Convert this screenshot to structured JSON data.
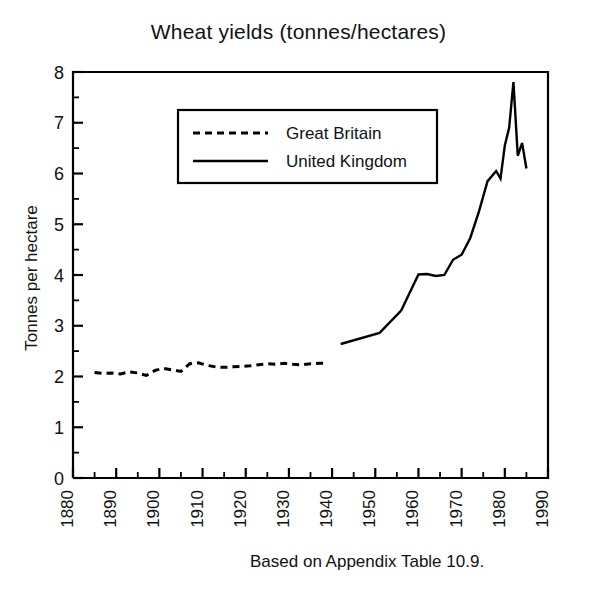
{
  "chart_data": {
    "type": "line",
    "title": "Wheat yields (tonnes/hectares)",
    "xlabel": "",
    "ylabel": "Tonnes per hectare",
    "xlim": [
      1880,
      1990
    ],
    "ylim": [
      0,
      8
    ],
    "grid": false,
    "legend_position": "upper-left-inside",
    "annotation": "Based on Appendix Table 10.9.",
    "x_ticks": [
      1880,
      1890,
      1900,
      1910,
      1920,
      1930,
      1940,
      1950,
      1960,
      1970,
      1980,
      1990
    ],
    "x_tick_labels": [
      "1880",
      "1890",
      "1900",
      "1910",
      "1920",
      "1930",
      "1940",
      "1950",
      "1960",
      "1970",
      "1980",
      "1990"
    ],
    "x_minor_tick_step": 5,
    "y_ticks": [
      0,
      1,
      2,
      3,
      4,
      5,
      6,
      7,
      8
    ],
    "y_tick_labels": [
      "0",
      "1",
      "2",
      "3",
      "4",
      "5",
      "6",
      "7",
      "8"
    ],
    "y_minor_tick_step": 0.5,
    "series": [
      {
        "name": "Great Britain",
        "style": "dashed",
        "color": "#000000",
        "x": [
          1885,
          1887,
          1889,
          1891,
          1893,
          1895,
          1897,
          1899,
          1901,
          1903,
          1905,
          1907,
          1909,
          1911,
          1913,
          1915,
          1917,
          1919,
          1921,
          1923,
          1925,
          1927,
          1929,
          1931,
          1933,
          1935,
          1937,
          1939
        ],
        "y": [
          2.08,
          2.06,
          2.07,
          2.05,
          2.09,
          2.07,
          2.02,
          2.12,
          2.16,
          2.13,
          2.1,
          2.25,
          2.27,
          2.22,
          2.19,
          2.18,
          2.19,
          2.2,
          2.21,
          2.23,
          2.25,
          2.24,
          2.26,
          2.24,
          2.23,
          2.25,
          2.26,
          2.26
        ]
      },
      {
        "name": "United Kingdom",
        "style": "solid",
        "color": "#000000",
        "x": [
          1942,
          1951,
          1956,
          1960,
          1962,
          1964,
          1966,
          1968,
          1970,
          1972,
          1974,
          1976,
          1978,
          1979,
          1980,
          1981,
          1982,
          1983,
          1984,
          1985
        ],
        "y": [
          2.64,
          2.86,
          3.3,
          4.01,
          4.02,
          3.98,
          4.0,
          4.3,
          4.4,
          4.73,
          5.25,
          5.85,
          6.05,
          5.9,
          6.55,
          6.9,
          7.8,
          6.35,
          6.6,
          6.1
        ]
      }
    ]
  },
  "legend": {
    "entries": [
      {
        "label": "Great Britain",
        "style": "dashed"
      },
      {
        "label": "United Kingdom",
        "style": "solid"
      }
    ]
  },
  "axes": {
    "y_axis_title": "Tonnes per hectare"
  }
}
